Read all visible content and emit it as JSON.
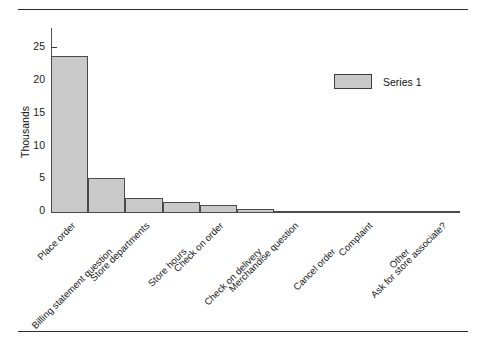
{
  "chart_data": {
    "type": "bar",
    "title": "",
    "subtitle": "",
    "xlabel": "",
    "ylabel": "Thousands",
    "ylim": [
      0,
      27
    ],
    "yticks": [
      0,
      5,
      10,
      15,
      20,
      25
    ],
    "ytick_labels": [
      "0",
      "5",
      "10",
      "15",
      "20",
      "25"
    ],
    "grid": false,
    "legend_position": "upper-right",
    "categories": [
      "Place order",
      "Billing statement question",
      "Store departments",
      "Store hours",
      "Check on order",
      "Check on delivery",
      "Merchandise question",
      "Cancel order",
      "Complaint",
      "Other",
      "Ask for store associate?"
    ],
    "series": [
      {
        "name": "Series 1",
        "color": "#c9c9c9",
        "edge_color": "#4a4a4a",
        "values": [
          24.0,
          5.4,
          2.3,
          1.7,
          1.2,
          0.6,
          0.2,
          0.15,
          0.12,
          0.1,
          0.1
        ]
      }
    ]
  },
  "legend": {
    "entries": [
      {
        "label": "Series 1",
        "color": "#c9c9c9"
      }
    ]
  },
  "axis": {
    "y_title": "Thousands",
    "y_tick_labels": [
      "25",
      "20",
      "15",
      "10",
      "5",
      "0"
    ]
  }
}
